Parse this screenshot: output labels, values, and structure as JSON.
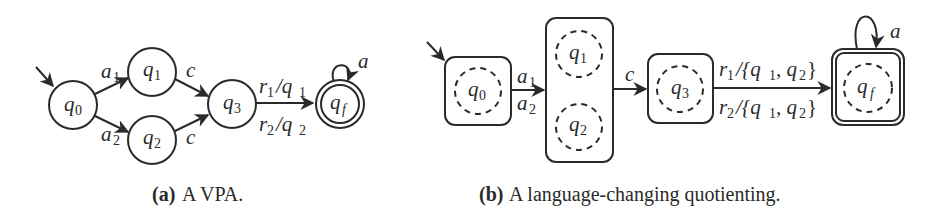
{
  "figure_a": {
    "caption_tag": "(a)",
    "caption_text": "A VPA.",
    "states": [
      {
        "id": "q0",
        "label": "q",
        "sub": "0",
        "initial": true,
        "accepting": false
      },
      {
        "id": "q1",
        "label": "q",
        "sub": "1",
        "initial": false,
        "accepting": false
      },
      {
        "id": "q2",
        "label": "q",
        "sub": "2",
        "initial": false,
        "accepting": false
      },
      {
        "id": "q3",
        "label": "q",
        "sub": "3",
        "initial": false,
        "accepting": false
      },
      {
        "id": "qf",
        "label": "q",
        "sub": "f",
        "initial": false,
        "accepting": true
      }
    ],
    "transitions": [
      {
        "from": "q0",
        "to": "q1",
        "label": "a",
        "sub": "1"
      },
      {
        "from": "q0",
        "to": "q2",
        "label": "a",
        "sub": "2"
      },
      {
        "from": "q1",
        "to": "q3",
        "label": "c",
        "sub": ""
      },
      {
        "from": "q2",
        "to": "q3",
        "label": "c",
        "sub": ""
      },
      {
        "from": "q3",
        "to": "qf",
        "label": "r",
        "sub": "1",
        "rest": "/q",
        "rest_sub": "1"
      },
      {
        "from": "q3",
        "to": "qf",
        "label": "r",
        "sub": "2",
        "rest": "/q",
        "rest_sub": "2"
      },
      {
        "from": "qf",
        "to": "qf",
        "label": "a",
        "sub": ""
      }
    ]
  },
  "figure_b": {
    "caption_tag": "(b)",
    "caption_text": "A language-changing quotienting.",
    "classes": [
      {
        "id": "c0",
        "members": [
          {
            "label": "q",
            "sub": "0"
          }
        ],
        "initial": true,
        "accepting": false
      },
      {
        "id": "c12",
        "members": [
          {
            "label": "q",
            "sub": "1"
          },
          {
            "label": "q",
            "sub": "2"
          }
        ],
        "initial": false,
        "accepting": false
      },
      {
        "id": "c3",
        "members": [
          {
            "label": "q",
            "sub": "3"
          }
        ],
        "initial": false,
        "accepting": false
      },
      {
        "id": "cf",
        "members": [
          {
            "label": "q",
            "sub": "f"
          }
        ],
        "initial": false,
        "accepting": true
      }
    ],
    "transitions": [
      {
        "from": "c0",
        "to": "c12",
        "labels": [
          {
            "label": "a",
            "sub": "1"
          },
          {
            "label": "a",
            "sub": "2"
          }
        ]
      },
      {
        "from": "c12",
        "to": "c3",
        "labels": [
          {
            "label": "c",
            "sub": ""
          }
        ]
      },
      {
        "from": "c3",
        "to": "cf",
        "labels": [
          {
            "label": "r",
            "sub": "1",
            "rest": "/{q",
            "s1": "1",
            "mid": ", q",
            "s2": "2",
            "end": "}"
          },
          {
            "label": "r",
            "sub": "2",
            "rest": "/{q",
            "s1": "1",
            "mid": ", q",
            "s2": "2",
            "end": "}"
          }
        ]
      },
      {
        "from": "cf",
        "to": "cf",
        "labels": [
          {
            "label": "a",
            "sub": ""
          }
        ]
      }
    ]
  }
}
